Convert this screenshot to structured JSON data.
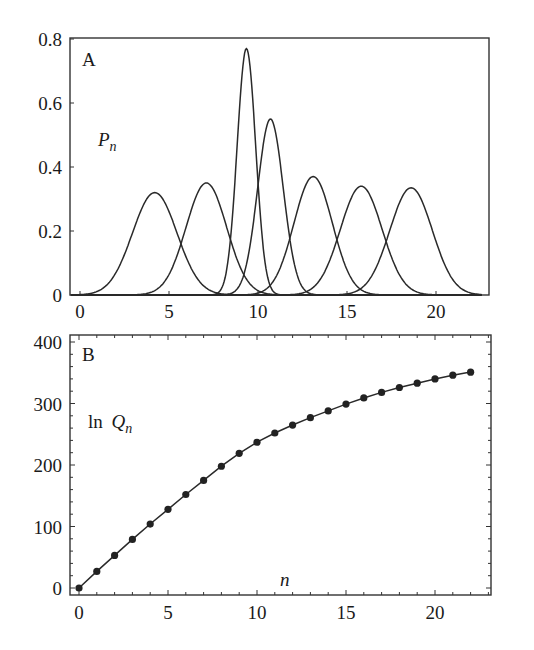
{
  "figure": {
    "panels": [
      {
        "id": "A",
        "letter": "A",
        "ylabel_main": "P",
        "ylabel_sub": "n",
        "x_ticks": [
          "0",
          "5",
          "10",
          "15",
          "20"
        ],
        "y_ticks": [
          "0",
          "0.2",
          "0.4",
          "0.6",
          "0.8"
        ]
      },
      {
        "id": "B",
        "letter": "B",
        "ylabel_prefix": "ln ",
        "ylabel_main": "Q",
        "ylabel_sub": "n",
        "xlabel": "n",
        "x_ticks": [
          "0",
          "5",
          "10",
          "15",
          "20"
        ],
        "y_ticks": [
          "0",
          "100",
          "200",
          "300",
          "400"
        ]
      }
    ]
  },
  "chart_data": [
    {
      "type": "line",
      "panel": "A",
      "title": "",
      "xlabel": "",
      "ylabel": "P_n",
      "xlim": [
        -0.6,
        23
      ],
      "ylim": [
        0,
        0.8
      ],
      "x_ticks": [
        0,
        5,
        10,
        15,
        20
      ],
      "y_ticks": [
        0,
        0.2,
        0.4,
        0.6,
        0.8
      ],
      "grid": false,
      "legend": null,
      "series": [
        {
          "name": "peak1",
          "center": 4.2,
          "height": 0.32,
          "sigma": 1.25
        },
        {
          "name": "peak2",
          "center": 7.1,
          "height": 0.35,
          "sigma": 1.14
        },
        {
          "name": "peak3",
          "center": 9.35,
          "height": 0.77,
          "sigma": 0.52
        },
        {
          "name": "peak4",
          "center": 10.7,
          "height": 0.55,
          "sigma": 0.72
        },
        {
          "name": "peak5",
          "center": 13.1,
          "height": 0.37,
          "sigma": 1.08
        },
        {
          "name": "peak6",
          "center": 15.8,
          "height": 0.34,
          "sigma": 1.17
        },
        {
          "name": "peak7",
          "center": 18.6,
          "height": 0.335,
          "sigma": 1.19
        }
      ]
    },
    {
      "type": "line",
      "panel": "B",
      "title": "",
      "xlabel": "n",
      "ylabel": "ln Q_n",
      "xlim": [
        -0.6,
        23
      ],
      "ylim": [
        -10,
        410
      ],
      "x_ticks": [
        0,
        5,
        10,
        15,
        20
      ],
      "y_ticks": [
        0,
        100,
        200,
        300,
        400
      ],
      "grid": false,
      "legend": null,
      "markers": true,
      "x": [
        0,
        1,
        2,
        3,
        4,
        5,
        6,
        7,
        8,
        9,
        10,
        11,
        12,
        13,
        14,
        15,
        16,
        17,
        18,
        19,
        20,
        21,
        22
      ],
      "values": [
        0,
        27,
        53,
        79,
        104,
        128,
        152,
        175,
        198,
        219,
        237,
        252,
        265,
        277,
        288,
        299,
        309,
        318,
        326,
        333,
        340,
        346,
        351
      ]
    }
  ]
}
